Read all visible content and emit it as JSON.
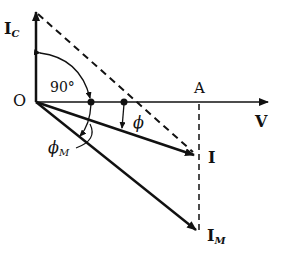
{
  "diagram": {
    "type": "phasor-diagram",
    "labels": {
      "origin": "O",
      "point_a": "A",
      "voltage": "V",
      "current": "I",
      "capacitor_current_main": "I",
      "capacitor_current_sub": "C",
      "motor_current_main": "I",
      "motor_current_sub": "M",
      "right_angle": "90°",
      "phi": "ϕ",
      "phi_m_main": "ϕ",
      "phi_m_sub": "M"
    },
    "colors": {
      "line": "#111111",
      "background": "#ffffff"
    }
  }
}
